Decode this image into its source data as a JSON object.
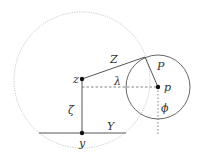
{
  "diagram": {
    "colors": {
      "line": "#444444",
      "big_circle": "#c8c8c8",
      "dashed": "#666666",
      "point": "#111111",
      "label": "#333333"
    },
    "points": {
      "z": {
        "label": "z",
        "x": 82,
        "y": 87
      },
      "p": {
        "label": "p",
        "x": 158,
        "y": 87
      },
      "y": {
        "label": "y",
        "x": 82,
        "y": 133
      }
    },
    "segments": {
      "Z": {
        "label": "Z"
      },
      "P": {
        "label": "P"
      },
      "Y": {
        "label": "Y"
      },
      "zeta": {
        "label": "ζ"
      },
      "lambda": {
        "label": "λ"
      },
      "phi": {
        "label": "ϕ"
      }
    },
    "circles": {
      "large": {
        "cx": 82,
        "cy": 80,
        "r": 68,
        "style": "dotted"
      },
      "small": {
        "cx": 158,
        "cy": 87,
        "r": 32,
        "style": "solid"
      }
    }
  }
}
